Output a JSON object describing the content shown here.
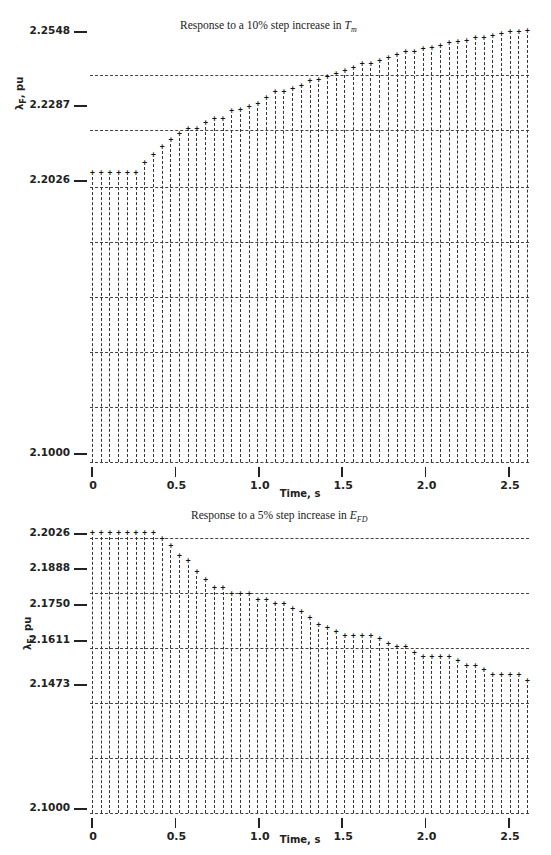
{
  "chart_data": [
    {
      "type": "line",
      "style": "line-printer plot (vertical dotted bars with '+' markers)",
      "title": "Response to a 10% step increase in T_m",
      "title_parts": {
        "prefix": "Response to a 10",
        "pct": "%",
        "middle": " step increase in ",
        "var": "T",
        "sub": "m"
      },
      "xlabel": "Time, s",
      "ylabel": "λ_F, pu",
      "ylabel_parts": {
        "sym": "λ",
        "sub": "F",
        "unit": ", pu"
      },
      "xlim": [
        0,
        2.5
      ],
      "ylim": [
        2.1,
        2.2548
      ],
      "xticks": [
        "0",
        "0.5",
        "1.0",
        "1.5",
        "2.0",
        "2.5"
      ],
      "yticks": [
        "2.2548",
        "2.2287",
        "2.2026",
        "2.1000"
      ],
      "grid": true,
      "x": [
        0.0,
        0.05,
        0.1,
        0.15,
        0.2,
        0.25,
        0.3,
        0.35,
        0.4,
        0.45,
        0.5,
        0.55,
        0.6,
        0.65,
        0.7,
        0.75,
        0.8,
        0.85,
        0.9,
        0.95,
        1.0,
        1.05,
        1.1,
        1.15,
        1.2,
        1.25,
        1.3,
        1.35,
        1.4,
        1.45,
        1.5,
        1.55,
        1.6,
        1.65,
        1.7,
        1.75,
        1.8,
        1.85,
        1.9,
        1.95,
        2.0,
        2.05,
        2.1,
        2.15,
        2.2,
        2.25,
        2.3,
        2.35,
        2.4,
        2.45,
        2.5
      ],
      "values": [
        2.2026,
        2.2026,
        2.2026,
        2.2026,
        2.2026,
        2.2026,
        2.2063,
        2.2092,
        2.2121,
        2.2147,
        2.2172,
        2.2187,
        2.2187,
        2.2209,
        2.2227,
        2.2227,
        2.2253,
        2.226,
        2.2271,
        2.2282,
        2.2304,
        2.2323,
        2.2323,
        2.2337,
        2.2348,
        2.2366,
        2.237,
        2.2381,
        2.2392,
        2.2403,
        2.2414,
        2.2428,
        2.2428,
        2.2439,
        2.245,
        2.2461,
        2.2472,
        2.2472,
        2.2483,
        2.2487,
        2.2494,
        2.2505,
        2.2509,
        2.2512,
        2.2523,
        2.2523,
        2.253,
        2.2538,
        2.2545,
        2.2545,
        2.2548
      ]
    },
    {
      "type": "line",
      "style": "line-printer plot (vertical dotted bars with '+' markers)",
      "title": "Response to a 5% step increase in E_FD",
      "title_parts": {
        "prefix": "Response to a 5",
        "pct": "%",
        "middle": " step increase in ",
        "var": "E",
        "sub": "FD"
      },
      "xlabel": "Time, s",
      "ylabel": "λ_F, pu",
      "ylabel_parts": {
        "sym": "λ",
        "sub": "F",
        "unit": ", pu"
      },
      "xlim": [
        0,
        2.5
      ],
      "ylim": [
        2.1,
        2.2026
      ],
      "xticks": [
        "0",
        "0.5",
        "1.0",
        "1.5",
        "2.0",
        "2.5"
      ],
      "yticks": [
        "2.2026",
        "2.1888",
        "2.1750",
        "2.1611",
        "2.1473",
        "2.1000"
      ],
      "grid": true,
      "x": [
        0.0,
        0.05,
        0.1,
        0.15,
        0.2,
        0.25,
        0.3,
        0.35,
        0.4,
        0.45,
        0.5,
        0.55,
        0.6,
        0.65,
        0.7,
        0.75,
        0.8,
        0.85,
        0.9,
        0.95,
        1.0,
        1.05,
        1.1,
        1.15,
        1.2,
        1.25,
        1.3,
        1.35,
        1.4,
        1.45,
        1.5,
        1.55,
        1.6,
        1.65,
        1.7,
        1.75,
        1.8,
        1.85,
        1.9,
        1.95,
        2.0,
        2.05,
        2.1,
        2.15,
        2.2,
        2.25,
        2.3,
        2.35,
        2.4,
        2.45,
        2.5
      ],
      "values": [
        2.2026,
        2.2026,
        2.2026,
        2.2026,
        2.2026,
        2.2026,
        2.2026,
        2.2026,
        2.2002,
        2.1976,
        2.1941,
        2.192,
        2.188,
        2.1851,
        2.1822,
        2.1822,
        2.1797,
        2.1797,
        2.1797,
        2.1776,
        2.1776,
        2.176,
        2.176,
        2.1741,
        2.173,
        2.1708,
        2.1684,
        2.167,
        2.1656,
        2.1641,
        2.1641,
        2.1641,
        2.1641,
        2.163,
        2.1611,
        2.1601,
        2.1601,
        2.158,
        2.1563,
        2.1563,
        2.1563,
        2.1563,
        2.1548,
        2.1531,
        2.1531,
        2.1515,
        2.1497,
        2.1497,
        2.1497,
        2.1497,
        2.1473
      ]
    }
  ],
  "layout": {
    "top": {
      "x0_px": 92,
      "x1_px": 509,
      "ytop_px": 31,
      "ybot_px": 453,
      "ylabel_px": [
        31,
        105,
        180,
        453
      ],
      "grid_y_px": [
        75,
        130,
        187,
        242,
        297,
        352,
        407,
        462
      ],
      "x_axis_y_px": 462,
      "title_pos": [
        180,
        27
      ],
      "xtitle_pos": [
        300,
        498
      ],
      "ytitle_pos": [
        22,
        82
      ]
    },
    "bottom": {
      "x0_px": 92,
      "x1_px": 509,
      "ytop_px": 533,
      "ybot_px": 808,
      "ylabel_px": [
        533,
        568,
        604,
        640,
        684,
        808
      ],
      "grid_y_px": [
        538,
        593,
        648,
        703,
        758,
        813
      ],
      "x_axis_y_px": 813,
      "title_pos": [
        191,
        517
      ],
      "xtitle_pos": [
        300,
        844
      ],
      "ytitle_pos": [
        30,
        622
      ]
    }
  }
}
